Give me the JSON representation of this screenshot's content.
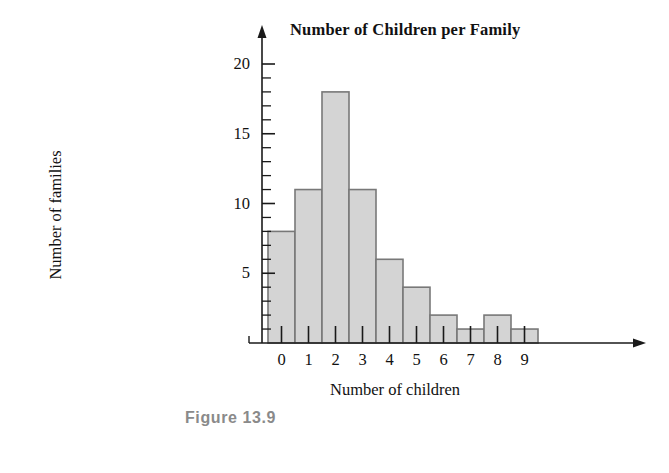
{
  "figure": {
    "caption": "Figure 13.9"
  },
  "chart_data": {
    "type": "bar",
    "title": "Number of Children per Family",
    "xlabel": "Number of children",
    "ylabel": "Number of families",
    "categories": [
      "0",
      "1",
      "2",
      "3",
      "4",
      "5",
      "6",
      "7",
      "8",
      "9"
    ],
    "values": [
      8,
      11,
      18,
      11,
      6,
      4,
      2,
      1,
      2,
      1
    ],
    "ylim": [
      0,
      21
    ],
    "xlim": [
      -1,
      11
    ],
    "ytick_labels": [
      "5",
      "10",
      "15",
      "20"
    ],
    "ytick_values": [
      5,
      10,
      15,
      20
    ],
    "ytick_minor_step": 1,
    "grid": false,
    "legend": "none",
    "bar_fill_color": "#d4d4d4",
    "bar_edge_color": "#787878",
    "axis_color": "#1a1a1a",
    "caption_color": "#8a8a8a"
  }
}
